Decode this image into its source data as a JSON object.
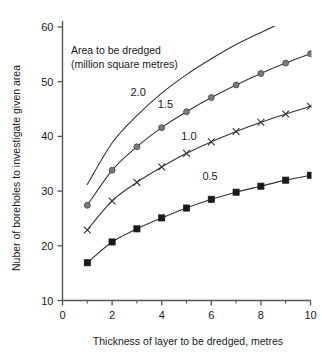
{
  "chart_data": {
    "type": "line",
    "title": "",
    "xlabel": "Thickness of layer to be dredged, metres",
    "ylabel": "Nuber of boreholes to investigate given area",
    "xlim": [
      0,
      10
    ],
    "ylim": [
      10,
      60
    ],
    "xticks": [
      0,
      2,
      4,
      6,
      8,
      10
    ],
    "xtick_labels": [
      "0",
      "2",
      "4",
      "6",
      "8",
      "10"
    ],
    "xminor_ticks": [
      1,
      3,
      5,
      7,
      9
    ],
    "yticks": [
      10,
      20,
      30,
      40,
      50,
      60
    ],
    "ytick_labels": [
      "10",
      "20",
      "30",
      "40",
      "50",
      "60"
    ],
    "grid": false,
    "legend_position": "inline-annotations",
    "annotation_title": "Area to be dredged",
    "annotation_subtitle": "(million  square metres)",
    "x": [
      1,
      2,
      3,
      4,
      5,
      6,
      7,
      8,
      9,
      10
    ],
    "series": [
      {
        "name": "2.0",
        "label": "2.0",
        "marker": "none",
        "color": "#333333",
        "marker_color": "#333333",
        "label_x": 3.05,
        "label_y": 47.3,
        "values": [
          31.2,
          38.8,
          43.8,
          47.9,
          51.3,
          54.2,
          56.8,
          59.0,
          61.1,
          62.9
        ],
        "clipped_above_axis": true
      },
      {
        "name": "1.5",
        "label": "1.5",
        "marker": "circle",
        "color": "#333333",
        "marker_color": "#7a7a7a",
        "label_x": 4.15,
        "label_y": 45.2,
        "values": [
          27.4,
          33.8,
          38.1,
          41.6,
          44.5,
          47.1,
          49.4,
          51.5,
          53.4,
          55.1
        ]
      },
      {
        "name": "1.0",
        "label": "1.0",
        "marker": "x",
        "color": "#333333",
        "marker_color": "#333333",
        "label_x": 5.1,
        "label_y": 39.3,
        "values": [
          22.9,
          28.2,
          31.6,
          34.4,
          36.9,
          39.0,
          40.9,
          42.6,
          44.1,
          45.5
        ]
      },
      {
        "name": "0.5",
        "label": "0.5",
        "marker": "square",
        "color": "#333333",
        "marker_color": "#1a1a1a",
        "label_x": 5.95,
        "label_y": 32.0,
        "values": [
          16.9,
          20.7,
          23.1,
          25.1,
          26.9,
          28.5,
          29.8,
          30.9,
          32.0,
          32.9
        ]
      }
    ]
  }
}
